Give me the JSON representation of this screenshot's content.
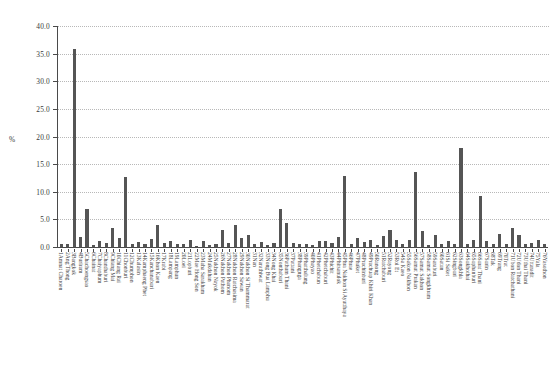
{
  "chart_data": {
    "type": "bar",
    "title": "",
    "xlabel": "",
    "ylabel": "%",
    "ylim": [
      0,
      40
    ],
    "yticks": [
      "0.0",
      "5.0",
      "10.0",
      "15.0",
      "20.0",
      "25.0",
      "30.0",
      "35.0",
      "40.0"
    ],
    "grid": true,
    "legend": false,
    "bar_color": "#555555",
    "categories": [
      "1Amnat Charoen",
      "2Ang Thong",
      "3Bangkok",
      "4Buriram",
      "5Chachoengsao",
      "6Chainat",
      "7Chaiyaphum",
      "8Chanthaburi",
      "9Chiang Mai",
      "10Chiang Rai",
      "11Chonburi",
      "12Chumphon",
      "13Kalasin",
      "14Kamphaeng Phet",
      "15Kanchanaburi",
      "16Khon Kaen",
      "17Krabi",
      "18Lampang",
      "19Lamphun",
      "20Loei",
      "21Lopburi",
      "22Mae Hong Son",
      "23Maha Sarakham",
      "24Mukdahan",
      "25Nakhon Nayok",
      "26Nakhon Pathom",
      "27Nakhon Phanom",
      "28Nakhon Ratchasima",
      "29Nakhon Sawan",
      "30Nakhon Si Thammarat",
      "31Nan",
      "32Narathiwat",
      "33Nong Bua Lamphu",
      "34Nong Khai",
      "35Nonthaburi",
      "36Pathum Thani",
      "37Pattani",
      "38Phangnga",
      "39Phatthalung",
      "40Phayao",
      "41Phetchabun",
      "42Phetchaburi",
      "43Phichit",
      "44Phitsanulok",
      "45Phra Nakhon Si Ayutthaya",
      "46Phrae",
      "47Phuket",
      "48Prachinburi",
      "49Prachuap Khiri Khan",
      "50Ranong",
      "51Ratchaburi",
      "52Rayong",
      "53Roi Et",
      "54Sa Kaeo",
      "55Sakon Nakhon",
      "56Samut Prakan",
      "57Samut Sakhon",
      "58Samut Songkhram",
      "59Saraburi",
      "60Satun",
      "61Si Saket",
      "62Singburi",
      "63Songkhla",
      "64Sukhothai",
      "65Suphanburi",
      "66Surat Thani",
      "67Surin",
      "68Tak",
      "69Trang",
      "70Trat",
      "71Ubon Ratchathani",
      "72Udon Thani",
      "73Uthai Thani",
      "74Uttaradit",
      "75Yala",
      "76Yasothon"
    ],
    "values": [
      0.5,
      0.6,
      35.9,
      1.9,
      6.8,
      0.4,
      1.0,
      0.8,
      3.4,
      1.7,
      12.6,
      0.6,
      0.9,
      0.5,
      1.5,
      3.9,
      0.7,
      1.0,
      0.6,
      0.6,
      1.3,
      0.2,
      1.1,
      0.4,
      0.5,
      3.0,
      0.7,
      4.0,
      1.6,
      2.2,
      0.5,
      0.9,
      0.4,
      0.8,
      6.9,
      4.4,
      0.8,
      0.5,
      0.6,
      0.4,
      1.1,
      1.0,
      0.7,
      1.9,
      12.8,
      0.6,
      1.7,
      0.9,
      1.2,
      0.3,
      2.0,
      3.1,
      1.3,
      0.6,
      1.2,
      13.6,
      2.9,
      0.4,
      2.2,
      0.5,
      1.1,
      0.5,
      18.0,
      0.6,
      1.3,
      9.3,
      1.0,
      0.5,
      2.4,
      0.6,
      3.4,
      2.2,
      0.5,
      0.7,
      1.2,
      0.6
    ]
  },
  "caption": {
    "text": ""
  }
}
